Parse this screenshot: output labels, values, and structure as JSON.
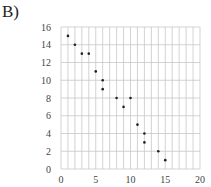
{
  "panel_label": "B)",
  "chart_data": {
    "type": "scatter",
    "title": "",
    "xlabel": "",
    "ylabel": "",
    "xlim": [
      0,
      20
    ],
    "ylim": [
      0,
      16
    ],
    "x_ticks": [
      0,
      5,
      10,
      15,
      20
    ],
    "y_ticks": [
      0,
      2,
      4,
      6,
      8,
      10,
      12,
      14,
      16
    ],
    "grid": true,
    "x_grid_step": 1,
    "y_grid_step": 2,
    "legend": null,
    "series": [
      {
        "name": "",
        "points": [
          {
            "x": 1,
            "y": 15
          },
          {
            "x": 2,
            "y": 14
          },
          {
            "x": 3,
            "y": 13
          },
          {
            "x": 4,
            "y": 13
          },
          {
            "x": 5,
            "y": 11
          },
          {
            "x": 6,
            "y": 10
          },
          {
            "x": 6,
            "y": 9
          },
          {
            "x": 8,
            "y": 8
          },
          {
            "x": 9,
            "y": 7
          },
          {
            "x": 10,
            "y": 8
          },
          {
            "x": 11,
            "y": 5
          },
          {
            "x": 12,
            "y": 4
          },
          {
            "x": 12,
            "y": 3
          },
          {
            "x": 14,
            "y": 2
          },
          {
            "x": 15,
            "y": 1
          }
        ]
      }
    ]
  },
  "colors": {
    "grid": "#c8c8c8",
    "point": "#222222",
    "tick_text": "#444444"
  }
}
